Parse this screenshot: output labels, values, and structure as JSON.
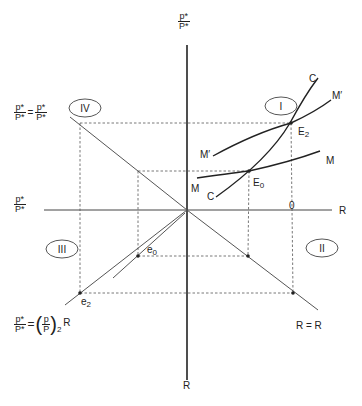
{
  "axes": {
    "top_label": {
      "num": "p*",
      "den": "P*"
    },
    "left_label": {
      "num": "p*",
      "den": "P*"
    },
    "right_label": "R",
    "bottom_label": "R",
    "origin_tick": "0"
  },
  "quadrants": {
    "I": "I",
    "II": "II",
    "III": "III",
    "IV": "IV"
  },
  "curves": {
    "C_top": "C",
    "C_bottom": "C",
    "M_right": "M",
    "M_left": "M",
    "Mprime_right": "M′",
    "Mprime_left": "M′"
  },
  "points": {
    "E2": {
      "main": "E",
      "sub": "2"
    },
    "E0": {
      "main": "E",
      "sub": "0"
    },
    "e0": {
      "main": "e",
      "sub": "0"
    },
    "e2": {
      "main": "e",
      "sub": "2"
    }
  },
  "equations": {
    "quadrant_iv": {
      "lhs_num": "p*",
      "lhs_den": "P*",
      "eq": "=",
      "rhs_num": "p*",
      "rhs_den": "P*"
    },
    "quadrant_iii": {
      "lhs_num": "p*",
      "lhs_den": "P*",
      "eq": "=",
      "inner_num": "p",
      "inner_den": "P",
      "sub": "2",
      "tail": "R"
    },
    "quadrant_ii": "R = R"
  },
  "colors": {
    "line": "#222222",
    "dashed": "#555555",
    "background": "#ffffff"
  }
}
